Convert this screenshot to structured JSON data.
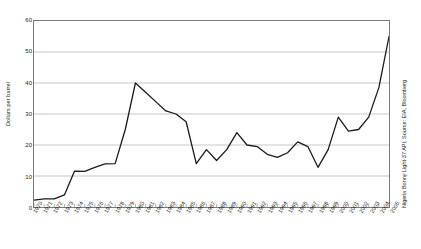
{
  "chart_data": {
    "type": "line",
    "title": "",
    "xlabel": "",
    "ylabel": "Dollars per barrel",
    "ylim": [
      0,
      60
    ],
    "ytick_step": 10,
    "yticks": [
      0,
      10,
      20,
      30,
      40,
      50,
      60
    ],
    "grid": true,
    "legend": "none",
    "series_name": "Nigeria Bonny Light-37 API",
    "annotation": "Nigeria Bonny Light-37 API, Source: EIA, Bloomberg",
    "line_color": "#1a1a1a",
    "grid_color": "#b0b0b0",
    "axis_color": "#7a7a7a",
    "categories": [
      "1970",
      "1971",
      "1972",
      "1973",
      "1974",
      "1975",
      "1976",
      "1977",
      "1978",
      "1979",
      "1980",
      "1981",
      "1982",
      "1983",
      "1984",
      "1985",
      "1986",
      "1987",
      "1988",
      "1989",
      "1990",
      "1991",
      "1992",
      "1993",
      "1994",
      "1995",
      "1996",
      "1997",
      "1998",
      "1999",
      "2000",
      "2001",
      "2002",
      "2003",
      "2004",
      "2005"
    ],
    "values": [
      2.2,
      2.6,
      2.6,
      3.9,
      11.6,
      11.5,
      12.8,
      13.9,
      14.0,
      25.0,
      40.0,
      37.0,
      34.0,
      31.0,
      30.0,
      27.5,
      14.0,
      18.5,
      15.0,
      18.5,
      24.0,
      20.0,
      19.5,
      17.0,
      16.0,
      17.5,
      21.0,
      19.5,
      12.8,
      18.5,
      29.0,
      24.5,
      25.0,
      29.0,
      38.5,
      55.0
    ]
  },
  "yticks_display": [
    "60",
    "50",
    "40",
    "30",
    "20",
    "10",
    "0"
  ]
}
